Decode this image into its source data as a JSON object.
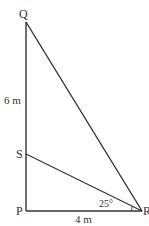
{
  "diagram": {
    "type": "right-triangle-geometry",
    "points": {
      "Q": {
        "label": "Q",
        "x": 26,
        "y": 22
      },
      "S": {
        "label": "S",
        "x": 26,
        "y": 154
      },
      "P": {
        "label": "P",
        "x": 26,
        "y": 211
      },
      "R": {
        "label": "R",
        "x": 142,
        "y": 211
      }
    },
    "segments": [
      {
        "from": "Q",
        "to": "P"
      },
      {
        "from": "P",
        "to": "R"
      },
      {
        "from": "Q",
        "to": "R"
      },
      {
        "from": "S",
        "to": "R"
      }
    ],
    "labels": {
      "qs_length": "6 m",
      "pr_length": "4 m",
      "angle_srp": "25°"
    },
    "colors": {
      "line": "#333333",
      "text": "#333333",
      "background": "#ffffff"
    }
  }
}
